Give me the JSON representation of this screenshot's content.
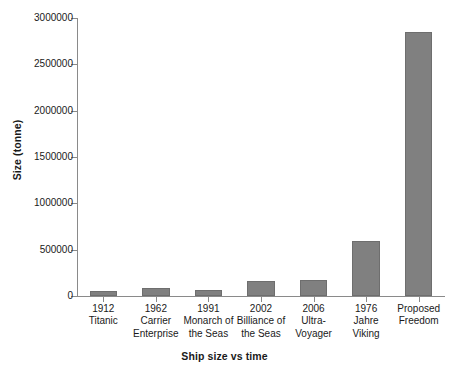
{
  "chart_data": {
    "type": "bar",
    "title": "",
    "xlabel": "Ship size vs time",
    "ylabel": "Size (tonne)",
    "categories": [
      "1912 Titanic",
      "1962 Carrier Enterprise",
      "1991 Monarch of the Seas",
      "2002 Billiance of the Seas",
      "2006 Ultra-Voyager",
      "1976 Jahre Viking",
      "Proposed Freedom"
    ],
    "category_lines": [
      [
        "1912",
        "Titanic"
      ],
      [
        "1962",
        "Carrier",
        "Enterprise"
      ],
      [
        "1991",
        "Monarch of",
        "the Seas"
      ],
      [
        "2002",
        "Billiance of",
        "the Seas"
      ],
      [
        "2006",
        "Ultra-",
        "Voyager"
      ],
      [
        "1976",
        "Jahre",
        "Viking"
      ],
      [
        "Proposed",
        "Freedom"
      ]
    ],
    "values": [
      55000,
      90000,
      70000,
      160000,
      170000,
      590000,
      2850000
    ],
    "ylim": [
      0,
      3000000
    ],
    "y_ticks": [
      0,
      500000,
      1000000,
      1500000,
      2000000,
      2500000,
      3000000
    ],
    "y_tick_labels": [
      "0",
      "500000",
      "1000000",
      "1500000",
      "2000000",
      "2500000",
      "3000000"
    ],
    "grid": false,
    "legend": false,
    "bar_color": "#808080",
    "bar_edge_color": "#6e6e6e",
    "axis_color": "#8a8a8a",
    "text_color": "#1a1a1a",
    "background_color": "#ffffff"
  }
}
